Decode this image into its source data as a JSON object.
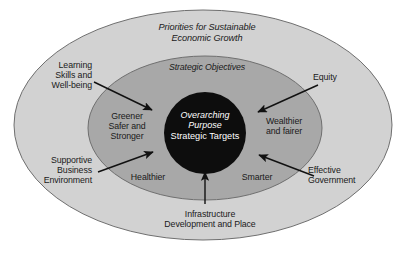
{
  "diagram": {
    "type": "concentric-ellipse-framework",
    "colors": {
      "outer_ring_fill": "#d2d2d2",
      "middle_ring_fill": "#a8a8a8",
      "core_fill": "#0d0d0d",
      "core_text": "#ffffff",
      "label_text": "#1a1a1a",
      "stroke": "#6b6b6b",
      "arrow": "#111111",
      "background": "#ffffff"
    },
    "rings": {
      "outer": {
        "label_line1": "Priorities for Sustainable",
        "label_line2": "Economic Growth",
        "label_full": "Priorities for Sustainable Economic Growth",
        "style": "italic"
      },
      "middle": {
        "label": "Strategic Objectives",
        "style": "italic"
      },
      "core": {
        "label_italic_line1": "Overarching",
        "label_italic_line2": "Purpose",
        "label_plain": "Strategic Targets"
      }
    },
    "objectives": [
      {
        "id": "greener",
        "text": "Greener\nSafer and\nStronger",
        "position": "left"
      },
      {
        "id": "wealthier",
        "text": "Wealthier\nand fairer",
        "position": "right"
      },
      {
        "id": "healthier",
        "text": "Healthier",
        "position": "bottom-left"
      },
      {
        "id": "smarter",
        "text": "Smarter",
        "position": "bottom-right"
      }
    ],
    "priorities": [
      {
        "id": "learning",
        "text": "Learning\nSkills and\nWell-being",
        "position": "top-left",
        "has_arrow": true
      },
      {
        "id": "equity",
        "text": "Equity",
        "position": "top-right",
        "has_arrow": true
      },
      {
        "id": "supportive",
        "text": "Supportive\nBusiness\nEnvironment",
        "position": "bottom-left",
        "has_arrow": true
      },
      {
        "id": "effective",
        "text": "Effective\nGovernment",
        "position": "bottom-right",
        "has_arrow": true
      },
      {
        "id": "infrastructure",
        "text": "Infrastructure\nDevelopment and Place",
        "position": "bottom",
        "has_arrow": true
      }
    ]
  }
}
